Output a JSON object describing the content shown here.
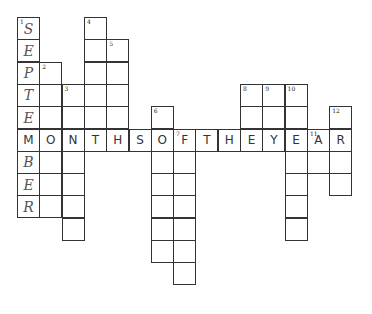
{
  "puzzle": {
    "type": "crossword",
    "title_across": "MONTHSOFTHEYEAR",
    "cell_size": 22.3,
    "origin": {
      "x": 17,
      "y": 17
    },
    "cells": [
      {
        "c": 0,
        "r": 0,
        "num": "1",
        "letter": "S",
        "style": "italic"
      },
      {
        "c": 0,
        "r": 1,
        "letter": "E",
        "style": "italic"
      },
      {
        "c": 0,
        "r": 2,
        "letter": "P",
        "style": "italic"
      },
      {
        "c": 0,
        "r": 3,
        "letter": "T",
        "style": "italic"
      },
      {
        "c": 0,
        "r": 4,
        "letter": "E",
        "style": "italic"
      },
      {
        "c": 0,
        "r": 5,
        "letter": "M"
      },
      {
        "c": 0,
        "r": 6,
        "letter": "B",
        "style": "italic"
      },
      {
        "c": 0,
        "r": 7,
        "letter": "E",
        "style": "italic"
      },
      {
        "c": 0,
        "r": 8,
        "letter": "R",
        "style": "italic"
      },
      {
        "c": 1,
        "r": 2,
        "num": "2"
      },
      {
        "c": 1,
        "r": 3
      },
      {
        "c": 1,
        "r": 4
      },
      {
        "c": 1,
        "r": 5,
        "letter": "O"
      },
      {
        "c": 1,
        "r": 6
      },
      {
        "c": 1,
        "r": 7
      },
      {
        "c": 1,
        "r": 8
      },
      {
        "c": 2,
        "r": 3,
        "num": "3"
      },
      {
        "c": 2,
        "r": 4
      },
      {
        "c": 2,
        "r": 5,
        "letter": "N"
      },
      {
        "c": 2,
        "r": 6
      },
      {
        "c": 2,
        "r": 7
      },
      {
        "c": 2,
        "r": 8
      },
      {
        "c": 2,
        "r": 9
      },
      {
        "c": 3,
        "r": 0,
        "num": "4"
      },
      {
        "c": 3,
        "r": 1
      },
      {
        "c": 3,
        "r": 2
      },
      {
        "c": 3,
        "r": 3
      },
      {
        "c": 3,
        "r": 4
      },
      {
        "c": 3,
        "r": 5,
        "letter": "T"
      },
      {
        "c": 4,
        "r": 1,
        "num": "5"
      },
      {
        "c": 4,
        "r": 2
      },
      {
        "c": 4,
        "r": 3
      },
      {
        "c": 4,
        "r": 4
      },
      {
        "c": 4,
        "r": 5,
        "letter": "H"
      },
      {
        "c": 5,
        "r": 5,
        "letter": "S"
      },
      {
        "c": 6,
        "r": 4,
        "num": "6"
      },
      {
        "c": 6,
        "r": 5,
        "letter": "O"
      },
      {
        "c": 6,
        "r": 6
      },
      {
        "c": 6,
        "r": 7
      },
      {
        "c": 6,
        "r": 8
      },
      {
        "c": 6,
        "r": 9
      },
      {
        "c": 6,
        "r": 10
      },
      {
        "c": 7,
        "r": 5,
        "num": "7",
        "letter": "F"
      },
      {
        "c": 7,
        "r": 6
      },
      {
        "c": 7,
        "r": 7
      },
      {
        "c": 7,
        "r": 8
      },
      {
        "c": 7,
        "r": 9
      },
      {
        "c": 7,
        "r": 10
      },
      {
        "c": 7,
        "r": 11
      },
      {
        "c": 8,
        "r": 5,
        "letter": "T"
      },
      {
        "c": 9,
        "r": 5,
        "letter": "H"
      },
      {
        "c": 10,
        "r": 3,
        "num": "8"
      },
      {
        "c": 10,
        "r": 4
      },
      {
        "c": 10,
        "r": 5,
        "letter": "E"
      },
      {
        "c": 11,
        "r": 3,
        "num": "9"
      },
      {
        "c": 11,
        "r": 4
      },
      {
        "c": 11,
        "r": 5,
        "letter": "Y"
      },
      {
        "c": 12,
        "r": 3,
        "num": "10"
      },
      {
        "c": 12,
        "r": 4
      },
      {
        "c": 12,
        "r": 5,
        "letter": "E"
      },
      {
        "c": 12,
        "r": 6
      },
      {
        "c": 12,
        "r": 7
      },
      {
        "c": 12,
        "r": 8
      },
      {
        "c": 12,
        "r": 9
      },
      {
        "c": 13,
        "r": 5,
        "num": "11",
        "letter": "A"
      },
      {
        "c": 13,
        "r": 6
      },
      {
        "c": 14,
        "r": 4,
        "num": "12"
      },
      {
        "c": 14,
        "r": 5,
        "letter": "R"
      },
      {
        "c": 14,
        "r": 6
      },
      {
        "c": 14,
        "r": 7
      }
    ]
  }
}
